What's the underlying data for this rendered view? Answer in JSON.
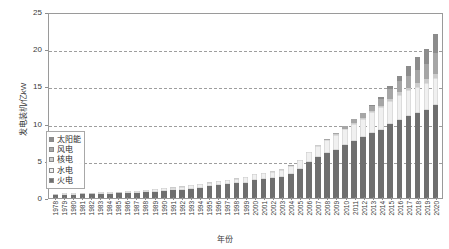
{
  "chart_data": {
    "type": "bar",
    "stacked": true,
    "title": "",
    "xlabel": "年份",
    "ylabel": "发电装机/亿kW",
    "ylim": [
      0,
      25
    ],
    "yticks": [
      0,
      5,
      10,
      15,
      20,
      25
    ],
    "grid": "horizontal-dashed",
    "legend_position": "inside-left",
    "categories": [
      "1978",
      "1979",
      "1980",
      "1981",
      "1982",
      "1983",
      "1984",
      "1985",
      "1986",
      "1987",
      "1988",
      "1989",
      "1990",
      "1991",
      "1992",
      "1993",
      "1994",
      "1995",
      "1996",
      "1997",
      "1998",
      "1999",
      "2000",
      "2001",
      "2002",
      "2003",
      "2004",
      "2005",
      "2006",
      "2007",
      "2008",
      "2009",
      "2010",
      "2011",
      "2012",
      "2013",
      "2014",
      "2015",
      "2016",
      "2017",
      "2018",
      "2019",
      "2020"
    ],
    "series": [
      {
        "name": "火电",
        "color": "#6f6f6f",
        "values": [
          0.4,
          0.44,
          0.46,
          0.48,
          0.5,
          0.53,
          0.56,
          0.61,
          0.66,
          0.72,
          0.79,
          0.87,
          0.95,
          1.03,
          1.12,
          1.24,
          1.39,
          1.55,
          1.69,
          1.84,
          1.96,
          2.05,
          2.38,
          2.54,
          2.66,
          2.84,
          3.25,
          3.91,
          4.84,
          5.54,
          6.03,
          6.51,
          7.07,
          7.65,
          8.19,
          8.7,
          9.16,
          9.9,
          10.54,
          11.06,
          11.44,
          11.89,
          12.45
        ]
      },
      {
        "name": "水电",
        "color": "#f0f0f0",
        "values": [
          0.17,
          0.18,
          0.2,
          0.21,
          0.22,
          0.24,
          0.25,
          0.26,
          0.27,
          0.28,
          0.3,
          0.32,
          0.36,
          0.38,
          0.41,
          0.45,
          0.49,
          0.52,
          0.55,
          0.6,
          0.65,
          0.72,
          0.79,
          0.83,
          0.86,
          0.94,
          1.05,
          1.17,
          1.29,
          1.45,
          1.72,
          1.96,
          2.16,
          2.33,
          2.49,
          2.8,
          3.02,
          3.2,
          3.32,
          3.41,
          3.53,
          3.56,
          3.7
        ]
      },
      {
        "name": "核电",
        "color": "#cccccc",
        "values": [
          0,
          0,
          0,
          0,
          0,
          0,
          0,
          0,
          0,
          0,
          0,
          0,
          0,
          0.03,
          0.03,
          0.03,
          0.03,
          0.03,
          0.03,
          0.03,
          0.03,
          0.03,
          0.03,
          0.05,
          0.05,
          0.06,
          0.07,
          0.07,
          0.07,
          0.09,
          0.09,
          0.09,
          0.11,
          0.13,
          0.13,
          0.15,
          0.2,
          0.27,
          0.34,
          0.36,
          0.45,
          0.49,
          0.5
        ]
      },
      {
        "name": "风电",
        "color": "#a6a6a6",
        "values": [
          0,
          0,
          0,
          0,
          0,
          0,
          0,
          0,
          0,
          0,
          0,
          0,
          0,
          0,
          0,
          0,
          0,
          0,
          0,
          0,
          0,
          0,
          0,
          0,
          0,
          0,
          0.01,
          0.01,
          0.03,
          0.06,
          0.12,
          0.18,
          0.31,
          0.46,
          0.61,
          0.76,
          0.96,
          1.31,
          1.49,
          1.64,
          1.84,
          2.1,
          2.82
        ]
      },
      {
        "name": "太阳能",
        "color": "#8c8c8c",
        "values": [
          0,
          0,
          0,
          0,
          0,
          0,
          0,
          0,
          0,
          0,
          0,
          0,
          0,
          0,
          0,
          0,
          0,
          0,
          0,
          0,
          0,
          0,
          0,
          0,
          0,
          0,
          0,
          0,
          0,
          0,
          0,
          0,
          0.003,
          0.02,
          0.03,
          0.16,
          0.25,
          0.42,
          0.77,
          1.3,
          1.74,
          2.04,
          2.53
        ]
      }
    ],
    "totals": [
      0.57,
      0.62,
      0.66,
      0.69,
      0.72,
      0.77,
      0.81,
      0.87,
      0.93,
      1.0,
      1.09,
      1.19,
      1.31,
      1.44,
      1.56,
      1.72,
      1.91,
      2.1,
      2.27,
      2.47,
      2.64,
      2.8,
      3.2,
      3.42,
      3.57,
      3.84,
      4.38,
      5.16,
      6.23,
      7.14,
      7.96,
      8.74,
      9.66,
      10.59,
      11.45,
      12.57,
      13.59,
      15.1,
      16.46,
      17.77,
      19.0,
      20.08,
      22.0
    ]
  },
  "legend": {
    "items": [
      {
        "label": "太阳能"
      },
      {
        "label": "风电"
      },
      {
        "label": "核电"
      },
      {
        "label": "水电"
      },
      {
        "label": "火电"
      }
    ]
  }
}
